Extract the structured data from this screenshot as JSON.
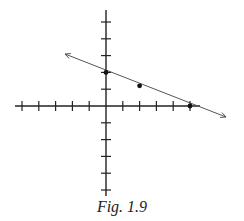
{
  "figure": {
    "caption": "Fig. 1.9",
    "line_color": "#555555",
    "axis_color": "#222222",
    "point_color": "#111111"
  },
  "chart_data": {
    "type": "line",
    "title": "Fig. 1.9",
    "xlabel": "",
    "ylabel": "",
    "grid": false,
    "xlim": [
      -5.5,
      5.5
    ],
    "ylim": [
      -5.5,
      5.5
    ],
    "x_ticks": [
      -5,
      -4,
      -3,
      -2,
      -1,
      1,
      2,
      3,
      4,
      5
    ],
    "y_ticks": [
      -5,
      -4,
      -3,
      -2,
      -1,
      1,
      2,
      3,
      4,
      5
    ],
    "tick_labels_shown": false,
    "series": [
      {
        "name": "line",
        "equation": "y = 2 - 0.4x",
        "arrows_both_ends": true,
        "x": [
          -5,
          7.2
        ],
        "y": [
          4,
          -0.9
        ]
      }
    ],
    "points": [
      {
        "x": 0,
        "y": 2
      },
      {
        "x": 2,
        "y": 1.2
      },
      {
        "x": 5,
        "y": 0
      }
    ]
  }
}
